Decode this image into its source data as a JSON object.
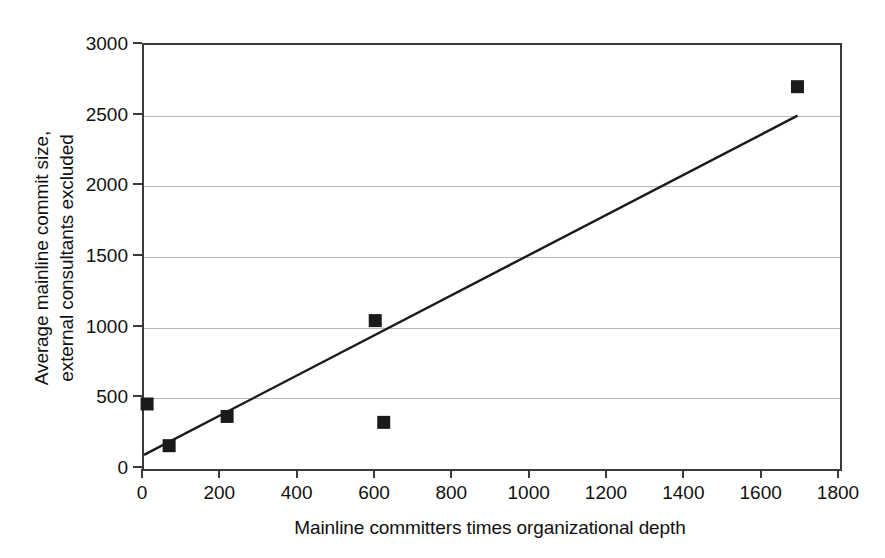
{
  "chart_data": {
    "type": "scatter",
    "title": "",
    "xlabel": "Mainline committers times organizational depth",
    "ylabel_line1": "Average mainline commit size,",
    "ylabel_line2": "external consultants excluded",
    "xlim": [
      0,
      1800
    ],
    "ylim": [
      0,
      3000
    ],
    "xticks": [
      0,
      200,
      400,
      600,
      800,
      1000,
      1200,
      1400,
      1600,
      1800
    ],
    "yticks": [
      0,
      500,
      1000,
      1500,
      2000,
      2500,
      3000
    ],
    "xtick_labels": [
      "0",
      "200",
      "400",
      "600",
      "800",
      "1000",
      "1200",
      "1400",
      "1600",
      "1800"
    ],
    "ytick_labels": [
      "0",
      "500",
      "1000",
      "1500",
      "2000",
      "2500",
      "3000"
    ],
    "grid": "horizontal",
    "legend": "none",
    "marker": "square",
    "marker_color": "#1a1a1a",
    "marker_size": 13,
    "series": [
      {
        "name": "projects",
        "points": [
          {
            "x": 8,
            "y": 460
          },
          {
            "x": 65,
            "y": 165
          },
          {
            "x": 215,
            "y": 372
          },
          {
            "x": 598,
            "y": 1050
          },
          {
            "x": 620,
            "y": 330
          },
          {
            "x": 1690,
            "y": 2705
          }
        ]
      }
    ],
    "trendline": {
      "type": "linear",
      "color": "#1a1a1a",
      "x_start": 0,
      "y_start": 100,
      "x_end": 1690,
      "y_end": 2500
    }
  },
  "axes": {
    "frame_color": "#3a3a3a",
    "gridline_color": "#b9b9b9"
  }
}
